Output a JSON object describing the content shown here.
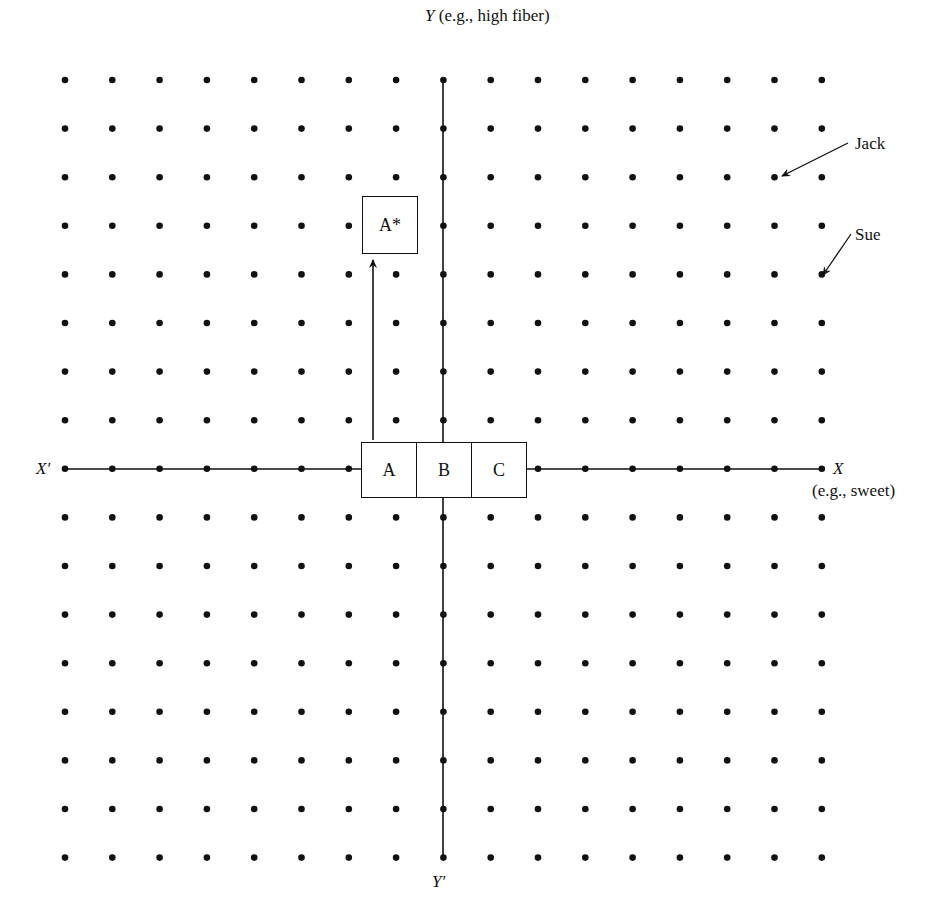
{
  "diagram": {
    "type": "perceptual-map",
    "grid": {
      "columns": 17,
      "rows": 17,
      "x0": 65,
      "y0": 80,
      "dx": 47.3,
      "dy": 48.6,
      "dot_color": "#111111"
    },
    "axes": {
      "y_top": {
        "symbol": "Y",
        "description": "(e.g., high fiber)"
      },
      "y_bottom": {
        "symbol": "Y′"
      },
      "x_left": {
        "symbol": "X′"
      },
      "x_right": {
        "symbol": "X",
        "description": "(e.g., sweet)"
      }
    },
    "products": [
      {
        "id": "A",
        "label": "A"
      },
      {
        "id": "B",
        "label": "B"
      },
      {
        "id": "C",
        "label": "C"
      }
    ],
    "repositioned": {
      "label": "A*",
      "from": "A"
    },
    "consumers": [
      {
        "name": "Jack",
        "col": 15,
        "row": 2
      },
      {
        "name": "Sue",
        "col": 16,
        "row": 4
      }
    ]
  }
}
